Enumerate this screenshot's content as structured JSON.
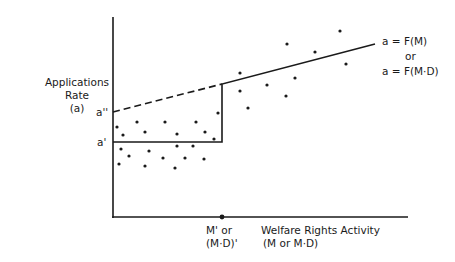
{
  "y_axis": {
    "title_line1": "Applications",
    "title_line2": "Rate",
    "title_line3": "(a)"
  },
  "y_ticks": {
    "a_double_prime": "a''",
    "a_prime": "a'"
  },
  "x_axis": {
    "tick_line1": "M' or",
    "tick_line2": "(M·D)'",
    "title_line1": "Welfare Rights Activity",
    "title_line2": "(M or M·D)"
  },
  "equation": {
    "line1": "a = F(M)",
    "or": "or",
    "line2": "a = F(M·D)"
  },
  "colors": {
    "ink": "#1a1a1a",
    "background": "#ffffff"
  },
  "chart_data": {
    "type": "scatter",
    "title": "",
    "xlabel": "Welfare Rights Activity (M or M·D)",
    "ylabel": "Applications Rate (a)",
    "x_tick_labels": [
      "M' or (M·D)'"
    ],
    "y_tick_labels": [
      "a''",
      "a'"
    ],
    "lines": [
      {
        "name": "lower level a'",
        "style": "solid",
        "from": [
          0,
          0.38
        ],
        "to": [
          0.37,
          0.38
        ]
      },
      {
        "name": "step",
        "style": "solid",
        "from": [
          0.37,
          0.38
        ],
        "to": [
          0.37,
          0.67
        ]
      },
      {
        "name": "a = F(M) upper",
        "style": "solid",
        "from": [
          0.37,
          0.67
        ],
        "to": [
          0.89,
          0.86
        ]
      },
      {
        "name": "counterfactual a''",
        "style": "dashed",
        "from": [
          0,
          0.53
        ],
        "to": [
          0.37,
          0.67
        ]
      }
    ],
    "points_px": [
      [
        117,
        127
      ],
      [
        137,
        122
      ],
      [
        165,
        122
      ],
      [
        196,
        122
      ],
      [
        218,
        113
      ],
      [
        123,
        135
      ],
      [
        145,
        132
      ],
      [
        177,
        134
      ],
      [
        205,
        132
      ],
      [
        214,
        139
      ],
      [
        121,
        149
      ],
      [
        129,
        156
      ],
      [
        149,
        151
      ],
      [
        163,
        158
      ],
      [
        177,
        146
      ],
      [
        193,
        146
      ],
      [
        185,
        158
      ],
      [
        204,
        159
      ],
      [
        119,
        164
      ],
      [
        145,
        166
      ],
      [
        175,
        168
      ],
      [
        240,
        73
      ],
      [
        287,
        44
      ],
      [
        315,
        52
      ],
      [
        340,
        31
      ],
      [
        346,
        64
      ],
      [
        240,
        91
      ],
      [
        267,
        85
      ],
      [
        295,
        78
      ],
      [
        286,
        96
      ],
      [
        248,
        108
      ]
    ],
    "grid": false,
    "annotations": [
      "a = F(M) or a = F(M·D)"
    ]
  }
}
